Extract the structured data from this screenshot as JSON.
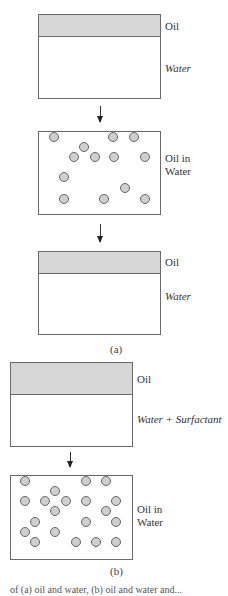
{
  "figure": {
    "panel_a": {
      "label": "(a)",
      "stage1": {
        "oil_label": "Oil",
        "water_label": "Water"
      },
      "stage2": {
        "label_line1": "Oil in",
        "label_line2": "Water",
        "droplets": [
          [
            54,
            137
          ],
          [
            113,
            137
          ],
          [
            134,
            137
          ],
          [
            84,
            147
          ],
          [
            74,
            157
          ],
          [
            95,
            157
          ],
          [
            114,
            157
          ],
          [
            145,
            157
          ],
          [
            64,
            177
          ],
          [
            125,
            188
          ],
          [
            64,
            199
          ],
          [
            104,
            199
          ],
          [
            145,
            199
          ]
        ]
      },
      "stage3": {
        "oil_label": "Oil",
        "water_label": "Water"
      }
    },
    "panel_b": {
      "label": "(b)",
      "stage1": {
        "oil_label": "Oil",
        "water_label": "Water + Surfactant"
      },
      "stage2": {
        "label_line1": "Oil in",
        "label_line2": "Water",
        "droplets": [
          [
            25,
            481
          ],
          [
            86,
            481
          ],
          [
            106,
            481
          ],
          [
            55,
            491
          ],
          [
            25,
            501
          ],
          [
            45,
            501
          ],
          [
            66,
            501
          ],
          [
            86,
            501
          ],
          [
            116,
            501
          ],
          [
            55,
            511
          ],
          [
            106,
            511
          ],
          [
            35,
            522
          ],
          [
            86,
            522
          ],
          [
            116,
            522
          ],
          [
            25,
            532
          ],
          [
            55,
            532
          ],
          [
            35,
            542
          ],
          [
            76,
            542
          ],
          [
            96,
            542
          ],
          [
            116,
            542
          ]
        ]
      }
    },
    "caption_partial": "of (a) oil and water, (b) oil and water and..."
  },
  "colors": {
    "oil": "#d7d7d7",
    "droplet": "#cfcfcf",
    "border": "#6a6a6a"
  }
}
